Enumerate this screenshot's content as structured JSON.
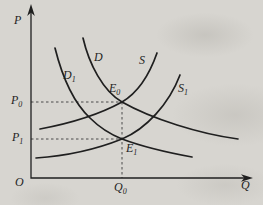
{
  "theme": {
    "paper": "#d7d5d0",
    "ink": "#1f1f1f",
    "dash": "#4a4a4a"
  },
  "figure": {
    "type": "supply-demand-diagram",
    "axes": {
      "y_label": {
        "base": "P",
        "sub": ""
      },
      "x_label": {
        "base": "Q",
        "sub": ""
      },
      "origin": {
        "base": "O",
        "sub": ""
      }
    },
    "curve_labels": {
      "d": {
        "base": "D",
        "sub": ""
      },
      "d1": {
        "base": "D",
        "sub": "1"
      },
      "s": {
        "base": "S",
        "sub": ""
      },
      "s1": {
        "base": "S",
        "sub": "1"
      }
    },
    "point_labels": {
      "e0": {
        "base": "E",
        "sub": "0"
      },
      "e1": {
        "base": "E",
        "sub": "1"
      },
      "p0": {
        "base": "P",
        "sub": "0"
      },
      "p1": {
        "base": "P",
        "sub": "1"
      },
      "q0": {
        "base": "Q",
        "sub": "0"
      }
    },
    "equilibria": [
      {
        "point": "E0",
        "price": "P0",
        "quantity": "Q0",
        "curves": [
          "D",
          "S"
        ]
      },
      {
        "point": "E1",
        "price": "P1",
        "quantity": "Q0",
        "curves": [
          "D1",
          "S1"
        ]
      }
    ],
    "guides": [
      {
        "from": "P0 on P-axis",
        "to": "E0",
        "style": "dashed"
      },
      {
        "from": "P1 on P-axis",
        "to": "E1",
        "style": "dashed"
      },
      {
        "from": "E0",
        "to": "Q0 on Q-axis",
        "style": "dashed"
      }
    ]
  }
}
